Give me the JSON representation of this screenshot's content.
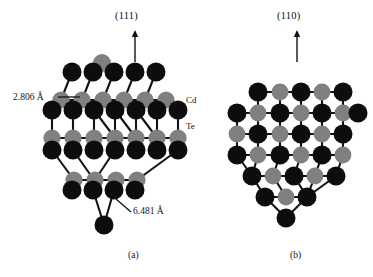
{
  "figure": {
    "background": "#ffffff",
    "panels": [
      {
        "id": "a",
        "caption": "(a)",
        "caption_pos": {
          "x": 128,
          "y": 250
        },
        "direction_label": "(111)",
        "direction_label_pos": {
          "x": 115,
          "y": 10
        },
        "arrow": {
          "x": 135,
          "y_top": 30,
          "y_bottom": 62
        },
        "annotations": [
          {
            "name": "bond-length-cd-te",
            "text": "2.806 Å",
            "x": 13,
            "y": 92,
            "leader": {
              "x1": 58,
              "y1": 97,
              "x2": 80,
              "y2": 97
            }
          },
          {
            "name": "lattice-constant",
            "text": "6.481 Å",
            "x": 133,
            "y": 212,
            "leader": {
              "x1": 131,
              "y1": 212,
              "x2": 116,
              "y2": 199
            }
          }
        ],
        "species_labels": [
          {
            "name": "cd-label",
            "text": "Cd",
            "x": 186,
            "y": 101
          },
          {
            "name": "te-label",
            "text": "Te",
            "x": 186,
            "y": 127
          }
        ]
      },
      {
        "id": "b",
        "caption": "(b)",
        "caption_pos": {
          "x": 290,
          "y": 250
        },
        "direction_label": "(110)",
        "direction_label_pos": {
          "x": 277,
          "y": 10
        },
        "arrow": {
          "x": 297,
          "y_top": 30,
          "y_bottom": 62
        },
        "annotations": [],
        "species_labels": []
      }
    ],
    "legend_semantics": {
      "cd_color": "#0d0d0d",
      "te_color": "#808080",
      "bond_color": "#141414"
    }
  },
  "atoms": {
    "panel_a": [
      {
        "x": 102,
        "y": 63,
        "r": 9.0,
        "el": "Te"
      },
      {
        "x": 72,
        "y": 72,
        "r": 9.5,
        "el": "Cd"
      },
      {
        "x": 93,
        "y": 72,
        "r": 9.5,
        "el": "Cd"
      },
      {
        "x": 114,
        "y": 72,
        "r": 9.5,
        "el": "Cd"
      },
      {
        "x": 135,
        "y": 72,
        "r": 9.5,
        "el": "Cd"
      },
      {
        "x": 156,
        "y": 72,
        "r": 9.5,
        "el": "Cd"
      },
      {
        "x": 61,
        "y": 100,
        "r": 8.6,
        "el": "Te"
      },
      {
        "x": 82,
        "y": 100,
        "r": 8.6,
        "el": "Te"
      },
      {
        "x": 103,
        "y": 100,
        "r": 8.6,
        "el": "Te"
      },
      {
        "x": 124,
        "y": 100,
        "r": 8.6,
        "el": "Te"
      },
      {
        "x": 145,
        "y": 100,
        "r": 8.6,
        "el": "Te"
      },
      {
        "x": 166,
        "y": 100,
        "r": 8.6,
        "el": "Te"
      },
      {
        "x": 52,
        "y": 110,
        "r": 9.5,
        "el": "Cd"
      },
      {
        "x": 73,
        "y": 110,
        "r": 9.5,
        "el": "Cd"
      },
      {
        "x": 94,
        "y": 110,
        "r": 9.5,
        "el": "Cd"
      },
      {
        "x": 115,
        "y": 110,
        "r": 9.5,
        "el": "Cd"
      },
      {
        "x": 136,
        "y": 110,
        "r": 9.5,
        "el": "Cd"
      },
      {
        "x": 157,
        "y": 110,
        "r": 9.5,
        "el": "Cd"
      },
      {
        "x": 178,
        "y": 110,
        "r": 9.5,
        "el": "Cd"
      },
      {
        "x": 52,
        "y": 138,
        "r": 8.6,
        "el": "Te"
      },
      {
        "x": 73,
        "y": 138,
        "r": 8.6,
        "el": "Te"
      },
      {
        "x": 94,
        "y": 138,
        "r": 8.6,
        "el": "Te"
      },
      {
        "x": 115,
        "y": 138,
        "r": 8.6,
        "el": "Te"
      },
      {
        "x": 136,
        "y": 138,
        "r": 8.6,
        "el": "Te"
      },
      {
        "x": 157,
        "y": 138,
        "r": 8.6,
        "el": "Te"
      },
      {
        "x": 178,
        "y": 138,
        "r": 8.6,
        "el": "Te"
      },
      {
        "x": 52,
        "y": 150,
        "r": 9.5,
        "el": "Cd"
      },
      {
        "x": 73,
        "y": 150,
        "r": 9.5,
        "el": "Cd"
      },
      {
        "x": 94,
        "y": 150,
        "r": 9.5,
        "el": "Cd"
      },
      {
        "x": 115,
        "y": 150,
        "r": 9.5,
        "el": "Cd"
      },
      {
        "x": 136,
        "y": 150,
        "r": 9.5,
        "el": "Cd"
      },
      {
        "x": 157,
        "y": 150,
        "r": 9.5,
        "el": "Cd"
      },
      {
        "x": 178,
        "y": 150,
        "r": 9.5,
        "el": "Cd"
      },
      {
        "x": 74,
        "y": 180,
        "r": 8.6,
        "el": "Te"
      },
      {
        "x": 95,
        "y": 180,
        "r": 8.6,
        "el": "Te"
      },
      {
        "x": 116,
        "y": 180,
        "r": 8.6,
        "el": "Te"
      },
      {
        "x": 137,
        "y": 180,
        "r": 8.6,
        "el": "Te"
      },
      {
        "x": 72,
        "y": 190,
        "r": 9.5,
        "el": "Cd"
      },
      {
        "x": 93,
        "y": 190,
        "r": 9.5,
        "el": "Cd"
      },
      {
        "x": 114,
        "y": 190,
        "r": 9.5,
        "el": "Cd"
      },
      {
        "x": 135,
        "y": 190,
        "r": 9.5,
        "el": "Cd"
      },
      {
        "x": 104,
        "y": 225,
        "r": 9.5,
        "el": "Cd"
      }
    ],
    "panel_b": [
      {
        "x": 258,
        "y": 92,
        "r": 9.5,
        "el": "Cd"
      },
      {
        "x": 280,
        "y": 92,
        "r": 8.4,
        "el": "Te"
      },
      {
        "x": 301,
        "y": 92,
        "r": 9.5,
        "el": "Cd"
      },
      {
        "x": 322,
        "y": 92,
        "r": 8.4,
        "el": "Te"
      },
      {
        "x": 343,
        "y": 92,
        "r": 9.5,
        "el": "Cd"
      },
      {
        "x": 237,
        "y": 113,
        "r": 9.5,
        "el": "Cd"
      },
      {
        "x": 258,
        "y": 113,
        "r": 8.4,
        "el": "Te"
      },
      {
        "x": 280,
        "y": 113,
        "r": 9.5,
        "el": "Cd"
      },
      {
        "x": 301,
        "y": 113,
        "r": 8.4,
        "el": "Te"
      },
      {
        "x": 322,
        "y": 113,
        "r": 9.5,
        "el": "Cd"
      },
      {
        "x": 343,
        "y": 113,
        "r": 8.4,
        "el": "Te"
      },
      {
        "x": 358,
        "y": 113,
        "r": 9.5,
        "el": "Cd"
      },
      {
        "x": 237,
        "y": 134,
        "r": 8.4,
        "el": "Te"
      },
      {
        "x": 258,
        "y": 134,
        "r": 9.5,
        "el": "Cd"
      },
      {
        "x": 280,
        "y": 134,
        "r": 8.4,
        "el": "Te"
      },
      {
        "x": 301,
        "y": 134,
        "r": 9.5,
        "el": "Cd"
      },
      {
        "x": 322,
        "y": 134,
        "r": 8.4,
        "el": "Te"
      },
      {
        "x": 343,
        "y": 134,
        "r": 9.5,
        "el": "Cd"
      },
      {
        "x": 237,
        "y": 155,
        "r": 9.5,
        "el": "Cd"
      },
      {
        "x": 258,
        "y": 155,
        "r": 8.4,
        "el": "Te"
      },
      {
        "x": 280,
        "y": 155,
        "r": 9.5,
        "el": "Cd"
      },
      {
        "x": 301,
        "y": 155,
        "r": 8.4,
        "el": "Te"
      },
      {
        "x": 322,
        "y": 155,
        "r": 9.5,
        "el": "Cd"
      },
      {
        "x": 343,
        "y": 155,
        "r": 8.4,
        "el": "Te"
      },
      {
        "x": 252,
        "y": 176,
        "r": 9.5,
        "el": "Cd"
      },
      {
        "x": 273,
        "y": 176,
        "r": 8.4,
        "el": "Te"
      },
      {
        "x": 294,
        "y": 176,
        "r": 9.5,
        "el": "Cd"
      },
      {
        "x": 315,
        "y": 176,
        "r": 8.4,
        "el": "Te"
      },
      {
        "x": 336,
        "y": 176,
        "r": 9.5,
        "el": "Cd"
      },
      {
        "x": 265,
        "y": 197,
        "r": 9.5,
        "el": "Cd"
      },
      {
        "x": 286,
        "y": 197,
        "r": 8.4,
        "el": "Te"
      },
      {
        "x": 307,
        "y": 197,
        "r": 9.5,
        "el": "Cd"
      },
      {
        "x": 286,
        "y": 218,
        "r": 9.5,
        "el": "Cd"
      }
    ]
  },
  "bonds": {
    "panel_a": [
      [
        102,
        63,
        93,
        72
      ],
      [
        102,
        63,
        114,
        72
      ],
      [
        72,
        72,
        61,
        100
      ],
      [
        93,
        72,
        82,
        100
      ],
      [
        114,
        72,
        103,
        100
      ],
      [
        135,
        72,
        124,
        100
      ],
      [
        156,
        72,
        145,
        100
      ],
      [
        61,
        100,
        52,
        110
      ],
      [
        82,
        100,
        73,
        110
      ],
      [
        103,
        100,
        94,
        110
      ],
      [
        124,
        100,
        115,
        110
      ],
      [
        145,
        100,
        136,
        110
      ],
      [
        166,
        100,
        157,
        110
      ],
      [
        61,
        100,
        82,
        100
      ],
      [
        82,
        100,
        103,
        100
      ],
      [
        103,
        100,
        124,
        100
      ],
      [
        124,
        100,
        145,
        100
      ],
      [
        145,
        100,
        166,
        100
      ],
      [
        52,
        110,
        52,
        138
      ],
      [
        73,
        110,
        73,
        138
      ],
      [
        94,
        110,
        94,
        138
      ],
      [
        115,
        110,
        115,
        138
      ],
      [
        136,
        110,
        136,
        138
      ],
      [
        157,
        110,
        157,
        138
      ],
      [
        178,
        110,
        178,
        138
      ],
      [
        52,
        138,
        73,
        138
      ],
      [
        73,
        138,
        94,
        138
      ],
      [
        94,
        138,
        115,
        138
      ],
      [
        115,
        138,
        136,
        138
      ],
      [
        136,
        138,
        157,
        138
      ],
      [
        157,
        138,
        178,
        138
      ],
      [
        52,
        138,
        52,
        150
      ],
      [
        73,
        138,
        73,
        150
      ],
      [
        94,
        138,
        94,
        150
      ],
      [
        115,
        138,
        115,
        150
      ],
      [
        136,
        138,
        136,
        150
      ],
      [
        157,
        138,
        157,
        150
      ],
      [
        178,
        138,
        178,
        150
      ],
      [
        74,
        180,
        95,
        180
      ],
      [
        95,
        180,
        116,
        180
      ],
      [
        116,
        180,
        137,
        180
      ],
      [
        72,
        190,
        74,
        180
      ],
      [
        93,
        190,
        95,
        180
      ],
      [
        114,
        190,
        116,
        180
      ],
      [
        135,
        190,
        137,
        180
      ],
      [
        104,
        225,
        93,
        190
      ],
      [
        104,
        225,
        114,
        190
      ],
      [
        52,
        150,
        74,
        180
      ],
      [
        178,
        150,
        137,
        180
      ],
      [
        94,
        110,
        115,
        138
      ],
      [
        115,
        110,
        136,
        138
      ],
      [
        136,
        110,
        157,
        138
      ],
      [
        73,
        150,
        94,
        180
      ],
      [
        115,
        150,
        95,
        180
      ]
    ],
    "panel_b": [
      [
        258,
        92,
        280,
        92
      ],
      [
        280,
        92,
        301,
        92
      ],
      [
        301,
        92,
        322,
        92
      ],
      [
        322,
        92,
        343,
        92
      ],
      [
        237,
        113,
        258,
        113
      ],
      [
        258,
        113,
        280,
        113
      ],
      [
        280,
        113,
        301,
        113
      ],
      [
        301,
        113,
        322,
        113
      ],
      [
        322,
        113,
        343,
        113
      ],
      [
        343,
        113,
        358,
        113
      ],
      [
        237,
        134,
        258,
        134
      ],
      [
        258,
        134,
        280,
        134
      ],
      [
        280,
        134,
        301,
        134
      ],
      [
        301,
        134,
        322,
        134
      ],
      [
        322,
        134,
        343,
        134
      ],
      [
        237,
        155,
        258,
        155
      ],
      [
        258,
        155,
        280,
        155
      ],
      [
        280,
        155,
        301,
        155
      ],
      [
        301,
        155,
        322,
        155
      ],
      [
        322,
        155,
        343,
        155
      ],
      [
        252,
        176,
        273,
        176
      ],
      [
        273,
        176,
        294,
        176
      ],
      [
        294,
        176,
        315,
        176
      ],
      [
        315,
        176,
        336,
        176
      ],
      [
        265,
        197,
        286,
        197
      ],
      [
        286,
        197,
        307,
        197
      ],
      [
        258,
        92,
        258,
        113
      ],
      [
        280,
        92,
        280,
        113
      ],
      [
        301,
        92,
        301,
        113
      ],
      [
        322,
        92,
        322,
        113
      ],
      [
        343,
        92,
        343,
        113
      ],
      [
        237,
        113,
        237,
        134
      ],
      [
        258,
        113,
        258,
        134
      ],
      [
        280,
        113,
        280,
        134
      ],
      [
        301,
        113,
        301,
        134
      ],
      [
        322,
        113,
        322,
        134
      ],
      [
        343,
        113,
        343,
        134
      ],
      [
        237,
        134,
        237,
        155
      ],
      [
        258,
        134,
        258,
        155
      ],
      [
        280,
        134,
        280,
        155
      ],
      [
        301,
        134,
        301,
        155
      ],
      [
        322,
        134,
        322,
        155
      ],
      [
        343,
        134,
        343,
        155
      ],
      [
        258,
        155,
        252,
        176
      ],
      [
        280,
        155,
        273,
        176
      ],
      [
        301,
        155,
        294,
        176
      ],
      [
        322,
        155,
        315,
        176
      ],
      [
        343,
        155,
        336,
        176
      ],
      [
        265,
        197,
        252,
        176
      ],
      [
        286,
        197,
        273,
        176
      ],
      [
        307,
        197,
        294,
        176
      ],
      [
        307,
        197,
        315,
        176
      ],
      [
        286,
        218,
        265,
        197
      ],
      [
        286,
        218,
        307,
        197
      ],
      [
        237,
        155,
        252,
        176
      ],
      [
        336,
        176,
        307,
        197
      ]
    ]
  }
}
